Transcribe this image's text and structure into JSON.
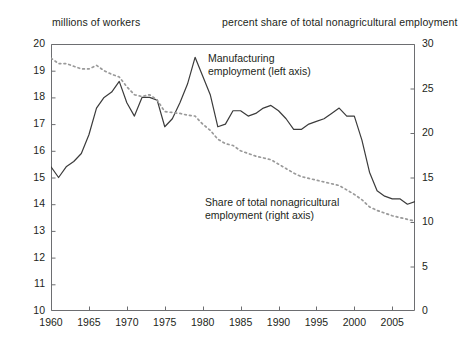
{
  "header": {
    "left_label": "millions of workers",
    "right_label": "percent share of total nonagricultural employment"
  },
  "annotations": {
    "manufacturing": {
      "line1": "Manufacturing",
      "line2": "employment (left axis)"
    },
    "share": {
      "line1": "Share of total nonagricultural",
      "line2": "employment (right axis)"
    }
  },
  "axes": {
    "left_ticks": [
      "20",
      "19",
      "18",
      "17",
      "16",
      "15",
      "14",
      "13",
      "12",
      "11",
      "10"
    ],
    "right_ticks": [
      "30",
      "25",
      "20",
      "15",
      "10",
      "5",
      "0"
    ],
    "x_ticks": [
      "1960",
      "1965",
      "1970",
      "1975",
      "1980",
      "1985",
      "1990",
      "1995",
      "2000",
      "2005"
    ]
  },
  "colors": {
    "line": "#3b3b3b",
    "dotted": "#9a9a9a",
    "axis": "#6d6e71",
    "text": "#231f20",
    "background": "#ffffff"
  },
  "chart_data": {
    "type": "line",
    "title": "",
    "xlabel": "",
    "ylabel": "millions of workers",
    "y2label": "percent share of total nonagricultural employment",
    "xlim": [
      1960,
      2008
    ],
    "ylim": [
      10,
      20
    ],
    "y2lim": [
      0,
      30
    ],
    "grid": false,
    "legend": "annotations",
    "x": [
      1960,
      1961,
      1962,
      1963,
      1964,
      1965,
      1966,
      1967,
      1968,
      1969,
      1970,
      1971,
      1972,
      1973,
      1974,
      1975,
      1976,
      1977,
      1978,
      1979,
      1980,
      1981,
      1982,
      1983,
      1984,
      1985,
      1986,
      1987,
      1988,
      1989,
      1990,
      1991,
      1992,
      1993,
      1994,
      1995,
      1996,
      1997,
      1998,
      1999,
      2000,
      2001,
      2002,
      2003,
      2004,
      2005,
      2006,
      2007,
      2008
    ],
    "series": [
      {
        "name": "Manufacturing employment (left axis)",
        "axis": "left",
        "style": "solid",
        "units": "millions of workers",
        "values": [
          15.4,
          15.0,
          15.4,
          15.6,
          15.9,
          16.6,
          17.6,
          18.0,
          18.2,
          18.6,
          17.8,
          17.3,
          18.0,
          18.0,
          17.9,
          16.9,
          17.2,
          17.8,
          18.5,
          19.5,
          18.8,
          18.1,
          16.9,
          17.0,
          17.5,
          17.5,
          17.3,
          17.4,
          17.6,
          17.7,
          17.5,
          17.2,
          16.8,
          16.8,
          17.0,
          17.1,
          17.2,
          17.4,
          17.6,
          17.3,
          17.3,
          16.4,
          15.2,
          14.5,
          14.3,
          14.2,
          14.2,
          14.0,
          14.1
        ]
      },
      {
        "name": "Share of total nonagricultural employment (right axis)",
        "axis": "right",
        "style": "dotted",
        "units": "percent",
        "values": [
          28.4,
          27.8,
          27.8,
          27.5,
          27.2,
          27.2,
          27.6,
          27.0,
          26.6,
          26.3,
          25.2,
          24.3,
          24.1,
          24.3,
          23.7,
          22.4,
          22.3,
          22.2,
          22.0,
          21.9,
          21.0,
          20.3,
          19.3,
          18.8,
          18.6,
          18.0,
          17.7,
          17.4,
          17.2,
          17.0,
          16.5,
          16.0,
          15.5,
          15.1,
          14.9,
          14.7,
          14.5,
          14.3,
          14.1,
          13.6,
          13.1,
          12.5,
          11.7,
          11.3,
          11.0,
          10.7,
          10.5,
          10.3,
          10.1
        ]
      }
    ]
  }
}
